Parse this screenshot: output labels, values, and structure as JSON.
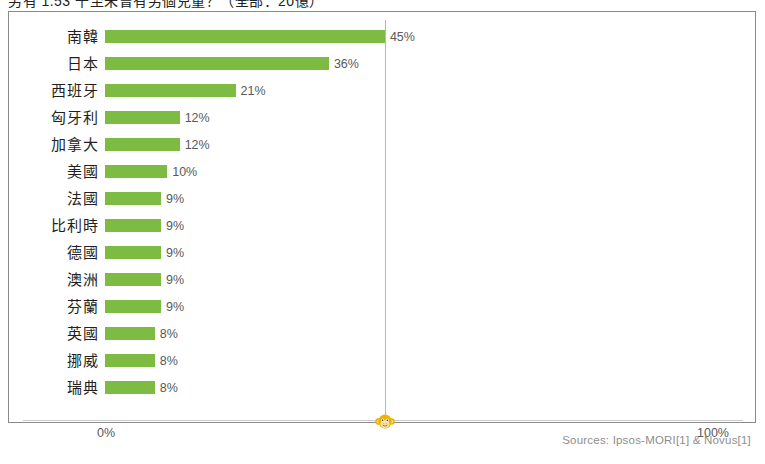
{
  "title": {
    "text": "另有 1.53 千至未曾有另個兒童？（全部：20億）"
  },
  "sources": {
    "text": "Sources: Ipsos-MORI[1] & Novus[1]"
  },
  "icons": {
    "marker": "monkey-icon"
  },
  "colors": {
    "bar": "#7dbb42",
    "reference_line": "#e8b53a",
    "label_text": "#231f20",
    "value_text": "#58595b",
    "frame": "#8a8a8a"
  },
  "axis": {
    "left_tick": "0%",
    "right_tick": "100%"
  },
  "chart_data": {
    "type": "bar",
    "orientation": "horizontal",
    "title": "另有 1.53 千至未曾有另個兒童？（全部：20億）",
    "xlabel": "",
    "ylabel": "",
    "xlim": [
      0,
      100
    ],
    "grid": false,
    "legend": null,
    "value_suffix": "%",
    "reference_line_x": 45,
    "categories": [
      "南韓",
      "日本",
      "西班牙",
      "匈牙利",
      "加拿大",
      "美國",
      "法國",
      "比利時",
      "德國",
      "澳洲",
      "芬蘭",
      "英國",
      "挪威",
      "瑞典"
    ],
    "values": [
      45,
      36,
      21,
      12,
      12,
      10,
      9,
      9,
      9,
      9,
      9,
      8,
      8,
      8
    ],
    "labels": [
      "45%",
      "36%",
      "21%",
      "12%",
      "12%",
      "10%",
      "9%",
      "9%",
      "9%",
      "9%",
      "9%",
      "8%",
      "8%",
      "8%"
    ]
  }
}
